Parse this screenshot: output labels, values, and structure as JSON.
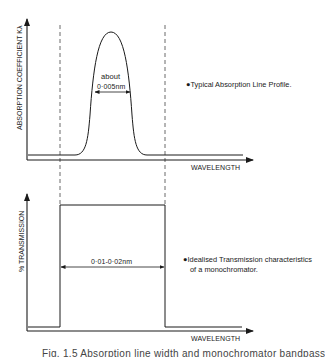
{
  "top_panel": {
    "y_axis_label": "ABSORPTION  COEFFICIENT  Kλ",
    "x_axis_label": "WAVELENGTH",
    "annotation_about": "about",
    "annotation_width": "0·005nm",
    "note": "●Typical Absorption Line Profile."
  },
  "bottom_panel": {
    "y_axis_label": "% TRANSMISSION",
    "x_axis_label": "WAVELENGTH",
    "annotation_width": "0·01-0·02nm",
    "note_line1": "●Idealised Transmission characteristics",
    "note_line2": "of a monochromator."
  },
  "caption": "Fig. 1.5  Absorption line width and monochromator bandpass"
}
